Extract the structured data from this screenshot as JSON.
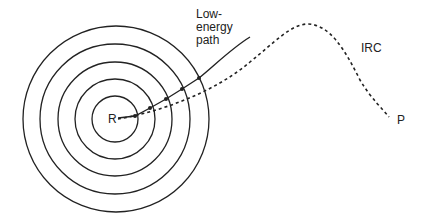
{
  "diagram": {
    "colors": {
      "stroke": "#222222",
      "background": "#ffffff"
    },
    "labels": {
      "reactant": "R",
      "product": "P",
      "irc": "IRC",
      "low_energy_path_line1": "Low-",
      "low_energy_path_line2": "energy",
      "low_energy_path_line3": "path"
    },
    "contours": {
      "center": [
        115,
        119
      ],
      "radii": [
        23,
        40,
        57,
        75,
        93
      ],
      "count": 5
    },
    "low_energy_path": {
      "style": "solid",
      "points": [
        [
          118,
          118
        ],
        [
          135,
          116
        ],
        [
          150,
          108
        ],
        [
          166,
          99
        ],
        [
          182,
          89
        ],
        [
          199,
          78
        ],
        [
          250,
          37
        ]
      ],
      "intersection_markers": [
        [
          135,
          116
        ],
        [
          150,
          108
        ],
        [
          166,
          99
        ],
        [
          182,
          89
        ],
        [
          199,
          78
        ]
      ]
    },
    "irc_path": {
      "style": "dashed",
      "from": "R",
      "to": "P",
      "peak": [
        307,
        24
      ],
      "end": [
        389,
        117
      ]
    }
  }
}
